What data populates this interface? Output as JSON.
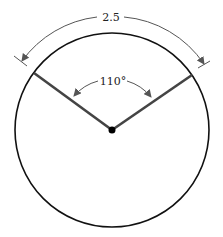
{
  "diagram": {
    "arc_length_label": "2.5",
    "central_angle_label": "110°",
    "colors": {
      "circle": "#111111",
      "radius": "#444444",
      "dimension": "#555555",
      "center_dot": "#000000"
    }
  }
}
